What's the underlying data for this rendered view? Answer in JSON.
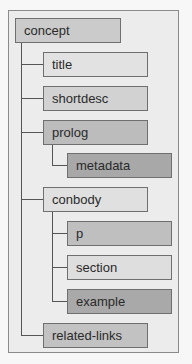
{
  "diagram": {
    "type": "tree",
    "colors": {
      "background": "#ececec",
      "frame_border": "#8a8a8a",
      "light": "#e4e4e4",
      "medium": "#cfcfcf",
      "medium_dark": "#bdbdbd",
      "dark": "#a9a9a9"
    },
    "nodes": [
      {
        "id": "concept",
        "label": "concept",
        "level": 0,
        "shade": "medium"
      },
      {
        "id": "title",
        "label": "title",
        "level": 1,
        "parent": "concept",
        "shade": "light"
      },
      {
        "id": "shortdesc",
        "label": "shortdesc",
        "level": 1,
        "parent": "concept",
        "shade": "medium"
      },
      {
        "id": "prolog",
        "label": "prolog",
        "level": 1,
        "parent": "concept",
        "shade": "medium_dark"
      },
      {
        "id": "metadata",
        "label": "metadata",
        "level": 2,
        "parent": "prolog",
        "shade": "dark"
      },
      {
        "id": "conbody",
        "label": "conbody",
        "level": 1,
        "parent": "concept",
        "shade": "light"
      },
      {
        "id": "p",
        "label": "p",
        "level": 2,
        "parent": "conbody",
        "shade": "medium_dark"
      },
      {
        "id": "section",
        "label": "section",
        "level": 2,
        "parent": "conbody",
        "shade": "light"
      },
      {
        "id": "example",
        "label": "example",
        "level": 2,
        "parent": "conbody",
        "shade": "dark"
      },
      {
        "id": "related-links",
        "label": "related-links",
        "level": 1,
        "parent": "concept",
        "shade": "medium"
      }
    ]
  }
}
